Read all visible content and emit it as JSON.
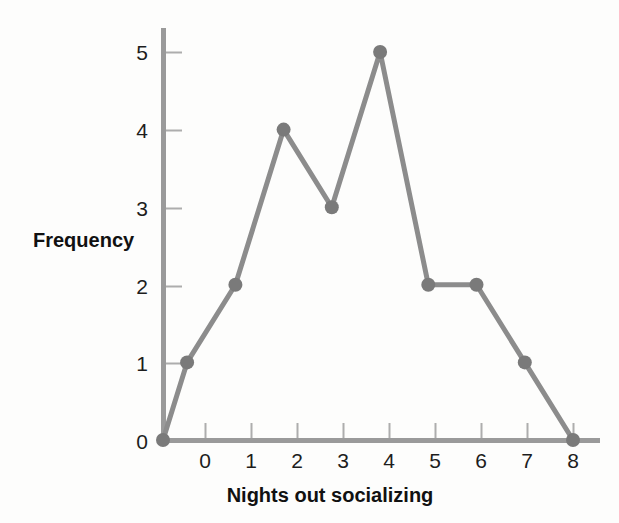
{
  "chart_data": {
    "type": "line",
    "title": "",
    "subtitle": "",
    "xlabel": "Nights out socializing",
    "ylabel": "Frequency",
    "xlim": [
      -0.6,
      8.4
    ],
    "ylim": [
      0,
      5.35
    ],
    "xticks": [
      0,
      1,
      2,
      3,
      4,
      5,
      6,
      7,
      8
    ],
    "xticklabels": [
      "0",
      "1",
      "2",
      "3",
      "4",
      "5",
      "6",
      "7",
      "8"
    ],
    "yticks": [
      0,
      1,
      2,
      3,
      4,
      5
    ],
    "yticklabels": [
      "0",
      "1",
      "2",
      "3",
      "4",
      "5"
    ],
    "grid": false,
    "legend": false,
    "legend_position": "none",
    "x": [
      -0.5,
      0,
      1,
      2,
      3,
      4,
      5,
      6,
      7,
      8
    ],
    "values": [
      0,
      1,
      2,
      4,
      3,
      5,
      2,
      2,
      1,
      0
    ],
    "series": [
      {
        "name": "Frequency",
        "x": [
          -0.5,
          0,
          1,
          2,
          3,
          4,
          5,
          6,
          7,
          8
        ],
        "values": [
          0,
          1,
          2,
          4,
          3,
          5,
          2,
          2,
          1,
          0
        ],
        "marker": "circle",
        "line_color": "#8c8c8c",
        "marker_color": "#7a7a7a"
      }
    ],
    "annotations": [],
    "colors": {
      "background": "#fdfdfc",
      "line": "#8c8c8c",
      "marker": "#7a7a7a",
      "axis": "#9a9a9a",
      "tick": "#adadad",
      "text": "#111111"
    }
  }
}
